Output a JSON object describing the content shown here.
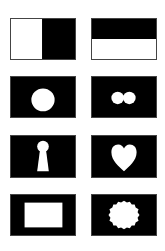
{
  "colors": {
    "background": "#ffffff",
    "fill_dark": "#000000",
    "fill_light": "#ffffff",
    "border": "#444444"
  },
  "cards": [
    {
      "id": "split-vertical",
      "shape": "left-half-white-right-half-black"
    },
    {
      "id": "split-horizontal",
      "shape": "top-half-black-bottom-half-white"
    },
    {
      "id": "single-circle",
      "shape": "white-circle-on-black"
    },
    {
      "id": "double-circle",
      "shape": "two-small-white-circles-on-black"
    },
    {
      "id": "keyhole",
      "shape": "white-keyhole-on-black"
    },
    {
      "id": "heart",
      "shape": "white-heart-on-black"
    },
    {
      "id": "rectangle",
      "shape": "white-rectangle-on-black"
    },
    {
      "id": "splat",
      "shape": "white-irregular-blob-on-black"
    }
  ]
}
